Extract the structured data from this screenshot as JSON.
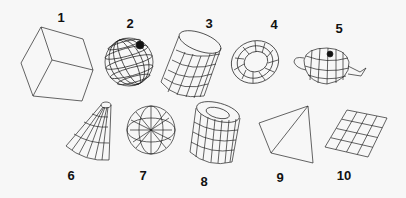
{
  "figure": {
    "labels": [
      {
        "id": "1",
        "text": "1",
        "x": 61,
        "y": 17
      },
      {
        "id": "2",
        "text": "2",
        "x": 130,
        "y": 23
      },
      {
        "id": "3",
        "text": "3",
        "x": 209,
        "y": 23
      },
      {
        "id": "4",
        "text": "4",
        "x": 274,
        "y": 24
      },
      {
        "id": "5",
        "text": "5",
        "x": 339,
        "y": 28
      },
      {
        "id": "6",
        "text": "6",
        "x": 71,
        "y": 175
      },
      {
        "id": "7",
        "text": "7",
        "x": 143,
        "y": 175
      },
      {
        "id": "8",
        "text": "8",
        "x": 204,
        "y": 181
      },
      {
        "id": "9",
        "text": "9",
        "x": 280,
        "y": 177
      },
      {
        "id": "10",
        "text": "10",
        "x": 344,
        "y": 175
      }
    ],
    "shapes": [
      {
        "n": "1",
        "name": "cube"
      },
      {
        "n": "2",
        "name": "sphere"
      },
      {
        "n": "3",
        "name": "cylinder"
      },
      {
        "n": "4",
        "name": "torus"
      },
      {
        "n": "5",
        "name": "teapot"
      },
      {
        "n": "6",
        "name": "cone"
      },
      {
        "n": "7",
        "name": "geosphere"
      },
      {
        "n": "8",
        "name": "tube"
      },
      {
        "n": "9",
        "name": "pyramid"
      },
      {
        "n": "10",
        "name": "plane"
      }
    ]
  }
}
